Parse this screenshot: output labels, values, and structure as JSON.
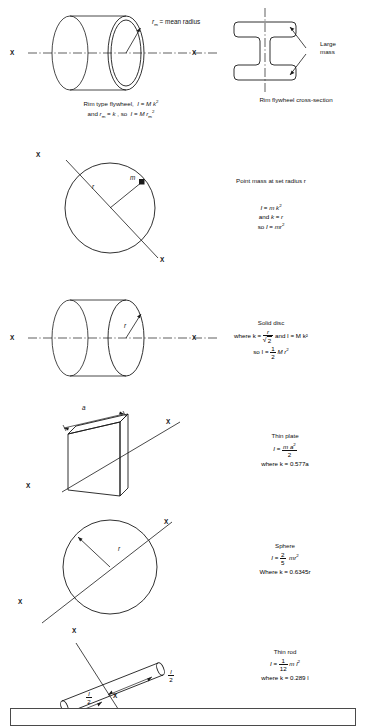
{
  "document": {
    "title": "Moments of inertia reference chart",
    "axis_label": "X"
  },
  "sections": [
    {
      "id": "rim-flywheel",
      "diagram_labels": {
        "radius_symbol": "r",
        "radius_subscript": "m",
        "radius_text": "= mean radius",
        "axis_left": "X",
        "axis_right": "X"
      },
      "caption_lines": [
        "Rim type flywheel,  I = M k²",
        "and rₘ = k , so  I = M rₘ²"
      ]
    },
    {
      "id": "rim-flywheel-cross-section",
      "annotation": "Large mass",
      "annotation_line1": "Large",
      "annotation_line2": "mass",
      "caption": "Rim flywheel cross-section"
    },
    {
      "id": "point-mass",
      "diagram_labels": {
        "axis_top": "X",
        "axis_bottom": "X",
        "radius_symbol": "r",
        "mass_symbol": "m"
      },
      "title": "Point mass at set radius r",
      "equations": [
        "I = m k²",
        "and k = r",
        "so I = mr²"
      ]
    },
    {
      "id": "solid-disc",
      "diagram_labels": {
        "axis_left": "X",
        "axis_right": "X",
        "radius_symbol": "r"
      },
      "title": "Solid disc",
      "equation_where": "where  k =",
      "equation_k_num": "r",
      "equation_k_den": "2",
      "equation_and": "and  I = M k²",
      "equation_so": "so  I =",
      "equation_half_num": "1",
      "equation_half_den": "2",
      "equation_tail": "M r²"
    },
    {
      "id": "thin-plate",
      "diagram_labels": {
        "side_symbol": "a",
        "axis_upper": "X",
        "axis_lower": "X"
      },
      "title": "Thin plate",
      "eq_lead": "I =",
      "eq_num": "m a²",
      "eq_den": "2",
      "eq_where": "where k = 0.577a"
    },
    {
      "id": "sphere",
      "diagram_labels": {
        "axis_upper": "X",
        "axis_lower": "X",
        "radius_symbol": "r"
      },
      "title": "Sphere",
      "eq_lead": "I =",
      "eq_num": "2",
      "eq_den": "5",
      "eq_tail": "mr²",
      "eq_where": "Where k = 0.6345r"
    },
    {
      "id": "thin-rod",
      "diagram_labels": {
        "axis_upper": "X",
        "axis_lower": "X",
        "half_len_num": "l",
        "half_len_den": "2"
      },
      "title": "Thin rod",
      "eq_lead": "I =",
      "eq_num": "1",
      "eq_den": "12",
      "eq_tail": "m l²",
      "eq_where": "where k = 0.289 l"
    }
  ],
  "colors": {
    "ink": "#1a1a1a",
    "box_border": "#4a4a4a",
    "background": "#ffffff"
  }
}
